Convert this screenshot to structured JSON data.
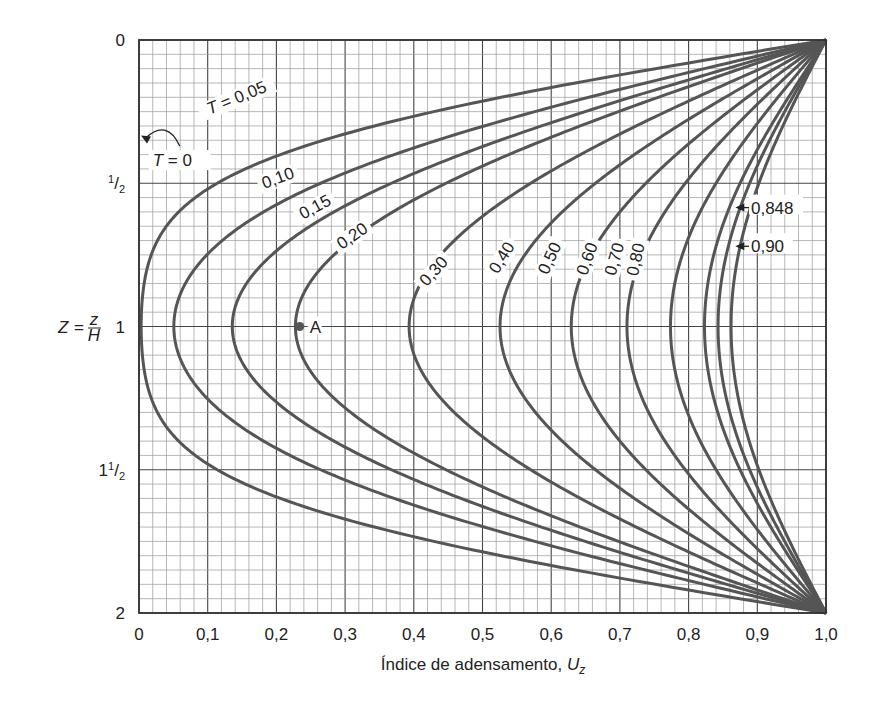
{
  "chart_data": {
    "type": "line",
    "title": "",
    "xlabel": "Índice de adensamento, U_z",
    "xlabel_main": "Índice de adensamento, ",
    "xlabel_var": "U",
    "xlabel_sub": "z",
    "ylabel": "Z = z/H",
    "ylabel_var": "Z",
    "ylabel_eq": "=",
    "ylabel_num": "z",
    "ylabel_den": "H",
    "xlim": [
      0,
      1.0
    ],
    "ylim": [
      0,
      2
    ],
    "y_inverted": true,
    "grid": true,
    "x_ticks": [
      {
        "value": 0,
        "label": "0"
      },
      {
        "value": 0.1,
        "label": "0,1"
      },
      {
        "value": 0.2,
        "label": "0,2"
      },
      {
        "value": 0.3,
        "label": "0,3"
      },
      {
        "value": 0.4,
        "label": "0,4"
      },
      {
        "value": 0.5,
        "label": "0,5"
      },
      {
        "value": 0.6,
        "label": "0,6"
      },
      {
        "value": 0.7,
        "label": "0,7"
      },
      {
        "value": 0.8,
        "label": "0,8"
      },
      {
        "value": 0.9,
        "label": "0,9"
      },
      {
        "value": 1.0,
        "label": "1,0"
      }
    ],
    "y_ticks": [
      {
        "value": 0,
        "label": "0"
      },
      {
        "value": 0.5,
        "label": "1/2"
      },
      {
        "value": 1,
        "label": "1"
      },
      {
        "value": 1.5,
        "label": "1 1/2"
      },
      {
        "value": 2,
        "label": "2"
      }
    ],
    "series_description": "Isócronas: U_z = 1 - Σ (2/M) sin(M·Z) exp(-M²·T), M = π(2m+1)/2",
    "series": [
      {
        "name": "T = 0,05",
        "T": 0.05,
        "label": "T = 0,05",
        "label_pos": [
          0.145,
          0.22
        ],
        "label_rot": -22,
        "U_at_Z1": 0.005,
        "U_at_Z05": 0.11
      },
      {
        "name": "0,10",
        "T": 0.1,
        "label": "0,10",
        "label_pos": [
          0.205,
          0.5
        ],
        "label_rot": -20,
        "U_at_Z1": 0.055
      },
      {
        "name": "0,15",
        "T": 0.15,
        "label": "0,15",
        "label_pos": [
          0.26,
          0.6
        ],
        "label_rot": -28,
        "U_at_Z1": 0.144
      },
      {
        "name": "0,20",
        "T": 0.2,
        "label": "0,20",
        "label_pos": [
          0.315,
          0.7
        ],
        "label_rot": -35,
        "U_at_Z1": 0.234
      },
      {
        "name": "0,30",
        "T": 0.3,
        "label": "0,30",
        "label_pos": [
          0.435,
          0.82
        ],
        "label_rot": -48,
        "U_at_Z1": 0.4
      },
      {
        "name": "0,40",
        "T": 0.4,
        "label": "0,40",
        "label_pos": [
          0.535,
          0.77
        ],
        "label_rot": -58,
        "U_at_Z1": 0.53
      },
      {
        "name": "0,50",
        "T": 0.5,
        "label": "0,50",
        "label_pos": [
          0.605,
          0.77
        ],
        "label_rot": -65,
        "U_at_Z1": 0.63
      },
      {
        "name": "0,60",
        "T": 0.6,
        "label": "0,60",
        "label_pos": [
          0.66,
          0.77
        ],
        "label_rot": -70,
        "U_at_Z1": 0.71
      },
      {
        "name": "0,70",
        "T": 0.7,
        "label": "0,70",
        "label_pos": [
          0.7,
          0.77
        ],
        "label_rot": -74,
        "U_at_Z1": 0.78
      },
      {
        "name": "0,80",
        "T": 0.8,
        "label": "0,80",
        "label_pos": [
          0.731,
          0.77
        ],
        "label_rot": -78,
        "U_at_Z1": 0.82
      },
      {
        "name": "0,848",
        "T": 0.848,
        "label": "0,848",
        "U_at_Z1": 0.845
      },
      {
        "name": "0,90",
        "T": 0.9,
        "label": "0,90",
        "U_at_Z1": 0.86
      }
    ],
    "annotations": [
      {
        "text": "T = 0",
        "var": "T",
        "rest": " = 0",
        "pos": [
          0.02,
          0.44
        ],
        "arrow_to": [
          0.0,
          0.33
        ]
      },
      {
        "text": "0,848",
        "pos": [
          0.885,
          0.585
        ],
        "arrow_to": [
          0.868,
          0.585
        ]
      },
      {
        "text": "0,90",
        "pos": [
          0.885,
          0.72
        ],
        "arrow_to": [
          0.868,
          0.72
        ]
      },
      {
        "text": "A",
        "point": [
          0.234,
          1.0
        ]
      }
    ],
    "point_A": {
      "label": "A",
      "U": 0.234,
      "Z": 1.0
    }
  },
  "colors": {
    "curve": "#555555",
    "grid_minor": "#9a9a9a",
    "grid_major": "#444444",
    "frame": "#333333",
    "text": "#222222"
  }
}
